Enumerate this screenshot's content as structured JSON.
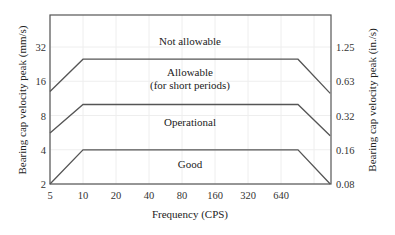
{
  "chart_data": {
    "type": "line",
    "title": "",
    "xlabel": "Frequency (CPS)",
    "ylabel": "Bearing cap velocity peak (mm/s)",
    "ylabel_right": "Bearing cap velocity peak (in./s)",
    "x_scale": "log2",
    "y_scale": "log2",
    "xlim": [
      5,
      1800
    ],
    "ylim": [
      2,
      50
    ],
    "x_ticks": [
      5,
      10,
      20,
      40,
      80,
      160,
      320,
      640
    ],
    "x_tick_labels": [
      "5",
      "10",
      "20",
      "40",
      "80",
      "160",
      "320",
      "640"
    ],
    "y_ticks": [
      2,
      4,
      8,
      16,
      32
    ],
    "y_tick_labels": [
      "2",
      "4",
      "8",
      "16",
      "32"
    ],
    "y_right_tick_labels": [
      "0.08",
      "0.16",
      "0.32",
      "0.63",
      "1.25"
    ],
    "grid": true,
    "series": [
      {
        "name": "Allowable / Not allowable boundary",
        "x": [
          5,
          10,
          1000,
          1800
        ],
        "y": [
          13,
          25,
          25,
          12.5
        ]
      },
      {
        "name": "Operational / Allowable boundary",
        "x": [
          5,
          10,
          1000,
          1800
        ],
        "y": [
          5.6,
          10,
          10,
          5.3
        ]
      },
      {
        "name": "Good / Operational boundary",
        "x": [
          5,
          10,
          1000,
          1800
        ],
        "y": [
          2,
          4,
          4,
          2
        ]
      }
    ],
    "zones": [
      {
        "label": "Not allowable",
        "x": 80,
        "y": 36
      },
      {
        "label": "Allowable",
        "label2": "(for short periods)",
        "x": 80,
        "y": 17
      },
      {
        "label": "Operational",
        "x": 80,
        "y": 7
      },
      {
        "label": "Good",
        "x": 80,
        "y": 3
      }
    ]
  },
  "colors": {
    "line": "#555555",
    "axis": "#555555",
    "grid": "#eeeeee",
    "text": "#222222"
  }
}
